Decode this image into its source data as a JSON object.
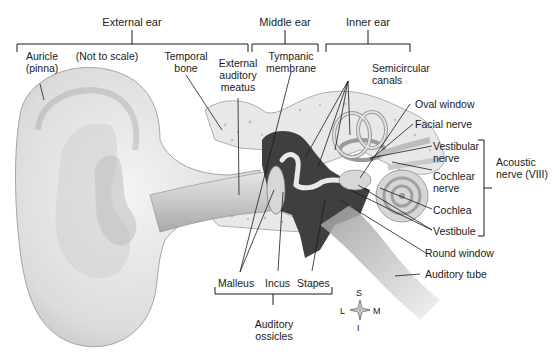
{
  "diagram": {
    "sections": {
      "external_ear": "External ear",
      "middle_ear": "Middle ear",
      "inner_ear": "Inner ear"
    },
    "note": "(Not to scale)",
    "labels": {
      "auricle_1": "Auricle",
      "auricle_2": "(pinna)",
      "temporal_1": "Temporal",
      "temporal_2": "bone",
      "eam_1": "External",
      "eam_2": "auditory",
      "eam_3": "meatus",
      "tympanic_1": "Tympanic",
      "tympanic_2": "membrane",
      "semicircular_1": "Semicircular",
      "semicircular_2": "canals",
      "oval_window": "Oval window",
      "facial_nerve": "Facial nerve",
      "vestibular_1": "Vestibular",
      "vestibular_2": "nerve",
      "cochlear_1": "Cochlear",
      "cochlear_2": "nerve",
      "acoustic_1": "Acoustic",
      "acoustic_2": "nerve (VIII)",
      "cochlea": "Cochlea",
      "vestibule": "Vestibule",
      "round_window": "Round window",
      "auditory_tube": "Auditory tube",
      "malleus": "Malleus",
      "incus": "Incus",
      "stapes": "Stapes",
      "ossicles_1": "Auditory",
      "ossicles_2": "ossicles"
    },
    "compass": {
      "S": "S",
      "I": "I",
      "L": "L",
      "M": "M"
    }
  }
}
